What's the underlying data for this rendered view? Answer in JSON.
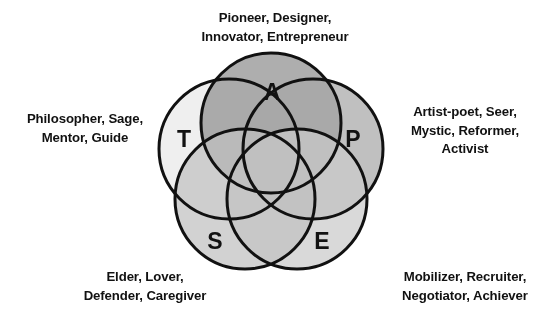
{
  "figure": {
    "type": "venn-rosette",
    "circle_count": 5,
    "background_color": "#ffffff",
    "stroke_color": "#111111",
    "stroke_width": 3,
    "text_color": "#111111",
    "center": {
      "x": 271,
      "y": 167
    },
    "circle_radius": 70,
    "offset_radius": 44,
    "circles": [
      {
        "key": "T",
        "letter": "T",
        "letter_x": 184,
        "letter_y": 139,
        "cx": 229,
        "cy": 149,
        "fill": "#e9e9e9",
        "opacity": 0.72
      },
      {
        "key": "A",
        "letter": "A",
        "letter_x": 272,
        "letter_y": 92,
        "cx": 271,
        "cy": 123,
        "fill": "#8f8f8f",
        "opacity": 0.72
      },
      {
        "key": "P",
        "letter": "P",
        "letter_x": 353,
        "letter_y": 139,
        "cx": 313,
        "cy": 149,
        "fill": "#a8a8a8",
        "opacity": 0.72
      },
      {
        "key": "E",
        "letter": "E",
        "letter_x": 322,
        "letter_y": 241,
        "cx": 297,
        "cy": 199,
        "fill": "#cacaca",
        "opacity": 0.72
      },
      {
        "key": "S",
        "letter": "S",
        "letter_x": 215,
        "letter_y": 241,
        "cx": 245,
        "cy": 199,
        "fill": "#c0c0c0",
        "opacity": 0.72
      }
    ]
  },
  "labels": {
    "top": {
      "id": "pioneer-group",
      "linked_circle": "A",
      "text": "Pioneer, Designer,\nInnovator, Entrepreneur",
      "lines": [
        "Pioneer, Designer,",
        "Innovator, Entrepreneur"
      ]
    },
    "left": {
      "id": "philosopher-group",
      "linked_circle": "T",
      "text": "Philosopher, Sage,\nMentor, Guide",
      "lines": [
        "Philosopher, Sage,",
        "Mentor, Guide"
      ]
    },
    "right": {
      "id": "artist-poet-group",
      "linked_circle": "P",
      "text": "Artist-poet, Seer,\nMystic, Reformer,\nActivist",
      "lines": [
        "Artist-poet, Seer,",
        "Mystic, Reformer,",
        "Activist"
      ]
    },
    "bottom_left": {
      "id": "elder-group",
      "linked_circle": "S",
      "text": "Elder, Lover,\nDefender, Caregiver",
      "lines": [
        "Elder, Lover,",
        "Defender, Caregiver"
      ]
    },
    "bottom_right": {
      "id": "mobilizer-group",
      "linked_circle": "E",
      "text": "Mobilizer, Recruiter,\nNegotiator, Achiever",
      "lines": [
        "Mobilizer, Recruiter,",
        "Negotiator, Achiever"
      ]
    }
  }
}
